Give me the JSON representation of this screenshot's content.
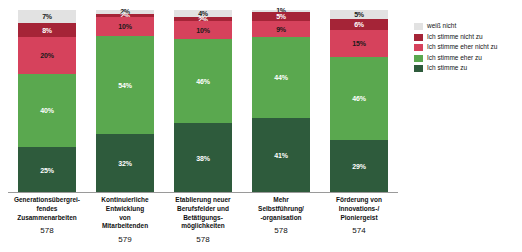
{
  "chart_data": {
    "type": "bar",
    "stacked": true,
    "stack_mode": "percent",
    "title": "",
    "subtitle": "",
    "xlabel": "",
    "ylabel": "",
    "ylim": [
      0,
      100
    ],
    "grid": false,
    "legend_position": "right",
    "orientation": "vertical",
    "value_suffix": "%",
    "categories": [
      "Generationsübergreifendes Zusammenarbeiten",
      "Kontinuierliche Entwicklung von Mitarbeitenden",
      "Etablierung neuer Berufsfelder und Betätigungsmöglichkeiten",
      "Mehr Selbstführung/-organisation",
      "Förderung von Innovations-/Pioniergeist"
    ],
    "category_lines": [
      [
        "Generationsübergrei-",
        "fendes",
        "Zusammenarbeiten"
      ],
      [
        "Kontinuierliche",
        "Entwicklung",
        "von",
        "Mitarbeitenden"
      ],
      [
        "Etablierung neuer",
        "Berufsfelder und",
        "Betätigungs-",
        "möglichkeiten"
      ],
      [
        "Mehr",
        "Selbstführung/",
        "-organisation"
      ],
      [
        "Förderung von",
        "Innovations-/",
        "Pioniergeist"
      ]
    ],
    "sample_sizes": [
      "578",
      "579",
      "578",
      "578",
      "574"
    ],
    "series": [
      {
        "name": "weiß nicht",
        "color": "#e2e2e2",
        "values": [
          7,
          2,
          4,
          1,
          5
        ]
      },
      {
        "name": "Ich stimme nicht zu",
        "color": "#a52437",
        "values": [
          8,
          2,
          2,
          5,
          6
        ]
      },
      {
        "name": "Ich stimme eher nicht zu",
        "color": "#d6425c",
        "values": [
          20,
          10,
          10,
          9,
          15
        ]
      },
      {
        "name": "Ich stimme eher zu",
        "color": "#5aa84f",
        "values": [
          40,
          54,
          46,
          44,
          46
        ]
      },
      {
        "name": "Ich stimme zu",
        "color": "#2e5b3c",
        "values": [
          25,
          32,
          38,
          41,
          29
        ]
      }
    ],
    "stack_order_top_to_bottom": [
      "weiß nicht",
      "Ich stimme nicht zu",
      "Ich stimme eher nicht zu",
      "Ich stimme eher zu",
      "Ich stimme zu"
    ]
  },
  "bars": [
    {
      "label_lines": [
        "Generationsübergrei-",
        "fendes",
        "Zusammenarbeiten"
      ],
      "n": "578",
      "segments": [
        {
          "series": "weiß nicht",
          "value": "7%",
          "pct": 7
        },
        {
          "series": "Ich stimme nicht zu",
          "value": "8%",
          "pct": 8
        },
        {
          "series": "Ich stimme eher nicht zu",
          "value": "20%",
          "pct": 20
        },
        {
          "series": "Ich stimme eher zu",
          "value": "40%",
          "pct": 40
        },
        {
          "series": "Ich stimme zu",
          "value": "25%",
          "pct": 25
        }
      ]
    },
    {
      "label_lines": [
        "Kontinuierliche",
        "Entwicklung",
        "von",
        "Mitarbeitenden"
      ],
      "n": "579",
      "segments": [
        {
          "series": "weiß nicht",
          "value": "2%",
          "pct": 2
        },
        {
          "series": "Ich stimme nicht zu",
          "value": "2%",
          "pct": 2
        },
        {
          "series": "Ich stimme eher nicht zu",
          "value": "10%",
          "pct": 10
        },
        {
          "series": "Ich stimme eher zu",
          "value": "54%",
          "pct": 54
        },
        {
          "series": "Ich stimme zu",
          "value": "32%",
          "pct": 32
        }
      ]
    },
    {
      "label_lines": [
        "Etablierung neuer",
        "Berufsfelder und",
        "Betätigungs-",
        "möglichkeiten"
      ],
      "n": "578",
      "segments": [
        {
          "series": "weiß nicht",
          "value": "4%",
          "pct": 4
        },
        {
          "series": "Ich stimme nicht zu",
          "value": "2%",
          "pct": 2
        },
        {
          "series": "Ich stimme eher nicht zu",
          "value": "10%",
          "pct": 10
        },
        {
          "series": "Ich stimme eher zu",
          "value": "46%",
          "pct": 46
        },
        {
          "series": "Ich stimme zu",
          "value": "38%",
          "pct": 38
        }
      ]
    },
    {
      "label_lines": [
        "Mehr",
        "Selbstführung/",
        "-organisation"
      ],
      "n": "578",
      "segments": [
        {
          "series": "weiß nicht",
          "value": "1%",
          "pct": 1
        },
        {
          "series": "Ich stimme nicht zu",
          "value": "5%",
          "pct": 5
        },
        {
          "series": "Ich stimme eher nicht zu",
          "value": "9%",
          "pct": 9
        },
        {
          "series": "Ich stimme eher zu",
          "value": "44%",
          "pct": 44
        },
        {
          "series": "Ich stimme zu",
          "value": "41%",
          "pct": 41
        }
      ]
    },
    {
      "label_lines": [
        "Förderung von",
        "Innovations-/",
        "Pioniergeist"
      ],
      "n": "574",
      "segments": [
        {
          "series": "weiß nicht",
          "value": "5%",
          "pct": 5
        },
        {
          "series": "Ich stimme nicht zu",
          "value": "6%",
          "pct": 6
        },
        {
          "series": "Ich stimme eher nicht zu",
          "value": "15%",
          "pct": 15
        },
        {
          "series": "Ich stimme eher zu",
          "value": "46%",
          "pct": 46
        },
        {
          "series": "Ich stimme zu",
          "value": "29%",
          "pct": 29
        }
      ]
    }
  ],
  "legend": {
    "items": [
      {
        "label": "weiß nicht",
        "color": "#e2e2e2",
        "class": "s-weiss"
      },
      {
        "label": "Ich stimme nicht zu",
        "color": "#a52437",
        "class": "s-nichtzu"
      },
      {
        "label": "Ich stimme eher nicht zu",
        "color": "#d6425c",
        "class": "s-ehernicht"
      },
      {
        "label": "Ich stimme eher zu",
        "color": "#5aa84f",
        "class": "s-eherzu"
      },
      {
        "label": "Ich stimme zu",
        "color": "#2e5b3c",
        "class": "s-zu"
      }
    ]
  }
}
